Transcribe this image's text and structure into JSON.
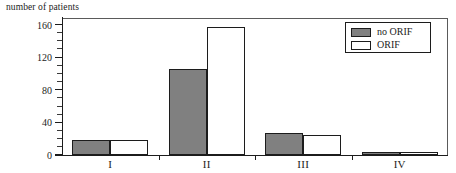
{
  "chart_data": {
    "type": "bar",
    "title": "",
    "subtitle": "",
    "xlabel": "",
    "ylabel": "number of patients",
    "categories": [
      "I",
      "II",
      "III",
      "IV"
    ],
    "series": [
      {
        "name": "no ORIF",
        "color": "#808080",
        "values": [
          19,
          105,
          27,
          3
        ]
      },
      {
        "name": "ORIF",
        "color": "#ffffff",
        "values": [
          18,
          157,
          25,
          3
        ]
      }
    ],
    "ylim": [
      0,
      168
    ],
    "yticks": [
      0,
      40,
      80,
      120,
      160
    ],
    "ytick_labels": [
      "0",
      "40",
      "80",
      "120",
      "160"
    ],
    "yminor_step": 10,
    "grid": false,
    "legend_position": "top-right"
  },
  "legend": {
    "entries": [
      {
        "label": "no ORIF",
        "swatch": "no-orif"
      },
      {
        "label": "ORIF",
        "swatch": "orif"
      }
    ]
  }
}
